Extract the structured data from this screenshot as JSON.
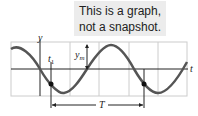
{
  "callout": {
    "line1": "This is a graph,",
    "line2": "not a snapshot."
  },
  "graph": {
    "y_axis_label": "y",
    "t_axis_label": "t",
    "t1_label": "t",
    "t1_sub": "1",
    "amplitude_label": "y",
    "amplitude_sub": "m",
    "period_label": "T"
  },
  "colors": {
    "curve": "#555555",
    "grid": "#cccccc",
    "axis": "#222222",
    "callout_bg": "#ececec"
  }
}
